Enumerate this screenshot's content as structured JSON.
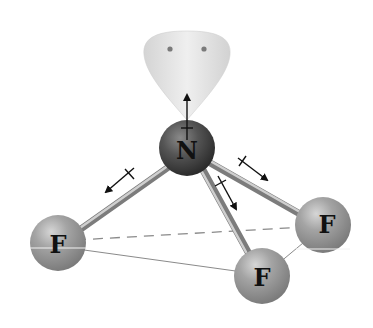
{
  "diagram": {
    "central_atom": {
      "label": "N",
      "x": 187,
      "y": 148,
      "r": 28
    },
    "outer_atoms": [
      {
        "id": "f-left",
        "label": "F",
        "x": 58,
        "y": 243,
        "r": 28
      },
      {
        "id": "f-right",
        "label": "F",
        "x": 323,
        "y": 225,
        "r": 28
      },
      {
        "id": "f-bottom",
        "label": "F",
        "x": 262,
        "y": 276,
        "r": 28
      }
    ],
    "lone_pair": {
      "electrons": 2
    },
    "dipole_arrows": [
      {
        "id": "lone-pair-dipole",
        "x1": 187,
        "y1": 140,
        "x2": 187,
        "y2": 93
      },
      {
        "id": "nf-left-dipole",
        "x1": 131,
        "y1": 171,
        "x2": 104,
        "y2": 193
      },
      {
        "id": "nf-right-dipole",
        "x1": 240,
        "y1": 160,
        "x2": 269,
        "y2": 181
      },
      {
        "id": "nf-bottom-dipole",
        "x1": 219,
        "y1": 178,
        "x2": 237,
        "y2": 211
      }
    ],
    "colors": {
      "nitrogen": "#4a4a4a",
      "fluorine": "#9a9a9a",
      "lone_pair_lobe": "#e2e2e2",
      "bond": "#a8a8a8",
      "arrow": "#111111",
      "base_lines": "#8a8a8a"
    }
  }
}
